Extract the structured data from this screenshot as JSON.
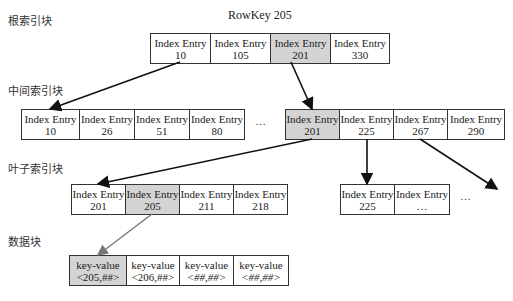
{
  "title": "RowKey 205",
  "levels": {
    "root": "根索引块",
    "middle": "中间索引块",
    "leaf": "叶子索引块",
    "data": "数据块"
  },
  "root_entries": [
    {
      "label": "Index Entry",
      "key": "10",
      "highlight": false
    },
    {
      "label": "Index Entry",
      "key": "105",
      "highlight": false
    },
    {
      "label": "Index Entry",
      "key": "201",
      "highlight": true
    },
    {
      "label": "Index Entry",
      "key": "330",
      "highlight": false
    }
  ],
  "middle_left_entries": [
    {
      "label": "Index Entry",
      "key": "10"
    },
    {
      "label": "Index Entry",
      "key": "26"
    },
    {
      "label": "Index Entry",
      "key": "51"
    },
    {
      "label": "Index Entry",
      "key": "80"
    }
  ],
  "middle_ellipsis": "…",
  "middle_right_entries": [
    {
      "label": "Index Entry",
      "key": "201",
      "highlight": true
    },
    {
      "label": "Index Entry",
      "key": "225"
    },
    {
      "label": "Index Entry",
      "key": "267"
    },
    {
      "label": "Index Entry",
      "key": "290"
    }
  ],
  "leaf_left_entries": [
    {
      "label": "Index Entry",
      "key": "201"
    },
    {
      "label": "Index Entry",
      "key": "205",
      "highlight": true
    },
    {
      "label": "Index Entry",
      "key": "211"
    },
    {
      "label": "Index Entry",
      "key": "218"
    }
  ],
  "leaf_right_entries": [
    {
      "label": "Index Entry",
      "key": "225"
    },
    {
      "label": "Index Entry",
      "key": "…"
    }
  ],
  "leaf_ellipsis": "…",
  "data_entries": [
    {
      "label": "key-value",
      "value": "<205,##>",
      "highlight": true
    },
    {
      "label": "key-value",
      "value": "<206,##>"
    },
    {
      "label": "key-value",
      "value": "<##,##>"
    },
    {
      "label": "key-value",
      "value": "<##,##>"
    }
  ],
  "colors": {
    "highlight": "#d4d4d4",
    "border": "#333333",
    "data_arrow": "#777777"
  }
}
